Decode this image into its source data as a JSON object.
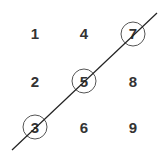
{
  "grid": {
    "cells": [
      {
        "label": "1",
        "x": 35,
        "y": 34,
        "circled": false
      },
      {
        "label": "4",
        "x": 84,
        "y": 34,
        "circled": false
      },
      {
        "label": "7",
        "x": 133,
        "y": 34,
        "circled": true
      },
      {
        "label": "2",
        "x": 35,
        "y": 82,
        "circled": false
      },
      {
        "label": "5",
        "x": 84,
        "y": 82,
        "circled": true
      },
      {
        "label": "8",
        "x": 133,
        "y": 82,
        "circled": false
      },
      {
        "label": "3",
        "x": 35,
        "y": 128,
        "circled": true
      },
      {
        "label": "6",
        "x": 84,
        "y": 128,
        "circled": false
      },
      {
        "label": "9",
        "x": 133,
        "y": 128,
        "circled": false
      }
    ]
  },
  "line": {
    "x1": 12,
    "y1": 150,
    "x2": 157,
    "y2": 13,
    "color": "#222222"
  },
  "circle_color": "#555555"
}
